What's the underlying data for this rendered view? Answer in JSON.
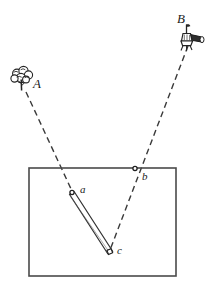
{
  "figure": {
    "background_color": "#ffffff",
    "ink_color": "#262626",
    "line_color": "#3a3a3a",
    "width": 214,
    "height": 282
  },
  "labels": {
    "station_a": "A",
    "station_b": "B",
    "point_a": "a",
    "point_b": "b",
    "point_c": "c"
  },
  "stations": [
    {
      "id": "A",
      "label": "A",
      "icon": "tree-icon",
      "description": "tree landmark observation station",
      "x": 22,
      "y": 76,
      "label_x": 33,
      "label_y": 88
    },
    {
      "id": "B",
      "label": "B",
      "icon": "theodolite-icon",
      "description": "surveying instrument on tripod observation station",
      "x": 192,
      "y": 33,
      "label_x": 183,
      "label_y": 22
    }
  ],
  "plot": {
    "name": "survey-plot-rectangle",
    "x": 29,
    "y": 168,
    "width": 147,
    "height": 108
  },
  "points": [
    {
      "id": "a",
      "label": "a",
      "x": 72,
      "y": 193,
      "marker": "small-circle",
      "label_x": 80,
      "label_y": 192
    },
    {
      "id": "b",
      "label": "b",
      "x": 135,
      "y": 169,
      "marker": "small-circle",
      "label_x": 143,
      "label_y": 180
    },
    {
      "id": "c",
      "label": "c",
      "x": 110,
      "y": 252,
      "marker": "small-square",
      "label_x": 117,
      "label_y": 253
    }
  ],
  "bar": {
    "name": "measuring-bar",
    "from": "a",
    "to": "c",
    "from_x": 72,
    "from_y": 196,
    "to_x": 110,
    "to_y": 253,
    "thickness": 5
  },
  "sight_lines": [
    {
      "id": "A-a",
      "from": "A",
      "to": "a",
      "style": "dashed",
      "x1": 26,
      "y1": 92,
      "x2": 72,
      "y2": 191
    },
    {
      "id": "B-b-c",
      "from": "B",
      "to": "c",
      "through": "b",
      "style": "dashed",
      "x1": 188,
      "y1": 46,
      "x2": 110,
      "y2": 250
    }
  ]
}
